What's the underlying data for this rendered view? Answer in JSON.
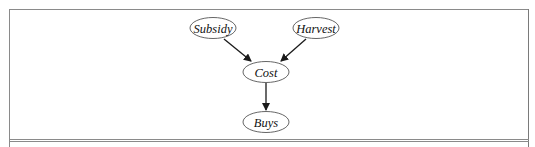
{
  "diagram": {
    "type": "bayesian-network",
    "nodes": [
      {
        "id": "subsidy",
        "label": "Subsidy",
        "cx": 213,
        "cy": 28,
        "rx": 23,
        "ry": 10.5
      },
      {
        "id": "harvest",
        "label": "Harvest",
        "cx": 316,
        "cy": 28,
        "rx": 23,
        "ry": 10.5
      },
      {
        "id": "cost",
        "label": "Cost",
        "cx": 266,
        "cy": 72,
        "rx": 23,
        "ry": 10.5
      },
      {
        "id": "buys",
        "label": "Buys",
        "cx": 266,
        "cy": 122,
        "rx": 23,
        "ry": 10.5
      }
    ],
    "edges": [
      {
        "from": "subsidy",
        "to": "cost"
      },
      {
        "from": "harvest",
        "to": "cost"
      },
      {
        "from": "cost",
        "to": "buys"
      }
    ],
    "colors": {
      "stroke": "#1a1a1a",
      "node_stroke": "#555555",
      "frame": "#7a7a7a",
      "text": "#111111"
    }
  }
}
